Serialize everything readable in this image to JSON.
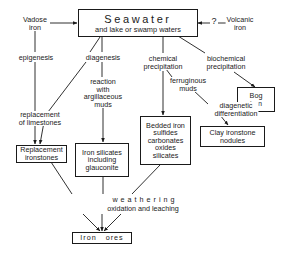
{
  "diagram": {
    "type": "flowchart",
    "stroke_color": "#1a1a1a",
    "background": "#ffffff",
    "nodes": {
      "seawater": {
        "title": "Seawater",
        "subtitle": "and lake or swamp waters"
      },
      "vadose_iron": {
        "lines": [
          "Vadose",
          "iron"
        ]
      },
      "volcanic_iron": {
        "lines": [
          "Volcanic",
          "iron"
        ]
      },
      "question_mark": "?",
      "bog_iron": {
        "lines": [
          "Bog",
          "iron"
        ]
      },
      "bedded_iron": {
        "lines": [
          "Bedded iron",
          "sulfides",
          "carbonates",
          "oxides",
          "silicates"
        ]
      },
      "replacement_ironstones": {
        "lines": [
          "Replacement",
          "ironstones"
        ]
      },
      "iron_silicates": {
        "lines": [
          "Iron silicates",
          "including",
          "glauconite"
        ]
      },
      "clay_ironstone": {
        "lines": [
          "Clay ironstone",
          "nodules"
        ]
      },
      "iron_ores": {
        "label": "Iron   ores"
      }
    },
    "process_labels": {
      "epigenesis": "epigenesis",
      "diagenesis": "diagenesis",
      "chemical_precipitation": [
        "chemical",
        "precipitation"
      ],
      "biochemical_precipitation": [
        "biochemical",
        "precipitation"
      ],
      "reaction_muds": [
        "reaction",
        "with",
        "argillaceous",
        "muds"
      ],
      "ferruginous_muds": [
        "ferruginous",
        "muds"
      ],
      "diagenetic_differentiation": [
        "diagenetic",
        "differentiation"
      ],
      "replacement_limestones": [
        "replacement",
        "of limestones"
      ],
      "weathering": "weathering",
      "oxidation_leaching": "oxidation and leaching"
    }
  }
}
